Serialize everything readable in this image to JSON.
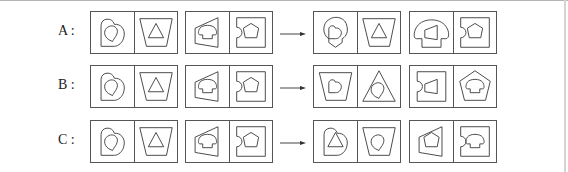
{
  "rows": [
    {
      "label": "A :",
      "question": [
        {
          "left": {
            "outer": "heart",
            "inner": "drop"
          },
          "right": {
            "outer": "trapezoid-inverted",
            "inner": "triangle"
          }
        },
        {
          "left": {
            "outer": "quad-slanted",
            "inner": "mushroom"
          },
          "right": {
            "outer": "notched-square",
            "inner": "pentagon"
          }
        }
      ],
      "answer": [
        {
          "left": {
            "outer": "drop",
            "inner": "heart"
          },
          "right": {
            "outer": "trapezoid-inverted",
            "inner": "triangle"
          }
        },
        {
          "left": {
            "outer": "mushroom",
            "inner": "quad-slanted"
          },
          "right": {
            "outer": "notched-square",
            "inner": "pentagon"
          }
        }
      ]
    },
    {
      "label": "B :",
      "question": [
        {
          "left": {
            "outer": "heart",
            "inner": "drop"
          },
          "right": {
            "outer": "trapezoid-inverted",
            "inner": "triangle"
          }
        },
        {
          "left": {
            "outer": "quad-slanted",
            "inner": "mushroom"
          },
          "right": {
            "outer": "notched-square",
            "inner": "pentagon"
          }
        }
      ],
      "answer": [
        {
          "left": {
            "outer": "trapezoid-inverted",
            "inner": "heart"
          },
          "right": {
            "outer": "triangle",
            "inner": "drop"
          }
        },
        {
          "left": {
            "outer": "notched-square",
            "inner": "quad-slanted"
          },
          "right": {
            "outer": "pentagon",
            "inner": "mushroom"
          }
        }
      ]
    },
    {
      "label": "C :",
      "question": [
        {
          "left": {
            "outer": "heart",
            "inner": "drop"
          },
          "right": {
            "outer": "trapezoid-inverted",
            "inner": "triangle"
          }
        },
        {
          "left": {
            "outer": "quad-slanted",
            "inner": "mushroom"
          },
          "right": {
            "outer": "notched-square",
            "inner": "pentagon"
          }
        }
      ],
      "answer": [
        {
          "left": {
            "outer": "heart",
            "inner": "triangle"
          },
          "right": {
            "outer": "trapezoid-inverted",
            "inner": "drop"
          }
        },
        {
          "left": {
            "outer": "quad-slanted",
            "inner": "pentagon"
          },
          "right": {
            "outer": "notched-square",
            "inner": "mushroom"
          }
        }
      ]
    }
  ],
  "arrow": "right-arrow",
  "colors": {
    "stroke": "#444444",
    "border": "#555555",
    "background": "#ffffff"
  }
}
